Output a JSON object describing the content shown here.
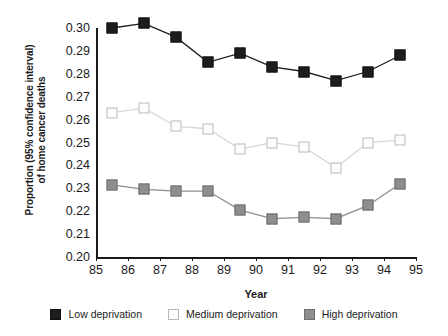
{
  "chart_data": {
    "type": "line",
    "title": "",
    "xlabel": "Year",
    "ylabel_line1": "Proportion (95% confidence interval)",
    "ylabel_line2": "of home cancer deaths",
    "x": [
      85.5,
      86.5,
      87.5,
      88.5,
      89.5,
      90.5,
      91.5,
      92.5,
      93.5,
      94.5
    ],
    "xlim": [
      85,
      95
    ],
    "ylim": [
      0.2,
      0.3
    ],
    "xticks": [
      "85",
      "86",
      "87",
      "88",
      "89",
      "90",
      "91",
      "92",
      "93",
      "94",
      "95"
    ],
    "xtick_values": [
      85,
      86,
      87,
      88,
      89,
      90,
      91,
      92,
      93,
      94,
      95
    ],
    "yticks": [
      "0.20",
      "0.21",
      "0.22",
      "0.23",
      "0.24",
      "0.25",
      "0.26",
      "0.27",
      "0.28",
      "0.29",
      "0.30"
    ],
    "ytick_values": [
      0.2,
      0.21,
      0.22,
      0.23,
      0.24,
      0.25,
      0.26,
      0.27,
      0.28,
      0.29,
      0.3
    ],
    "grid": false,
    "legend_position": "bottom",
    "series": [
      {
        "name": "Low deprivation",
        "color": "#1d1d1d",
        "marker": "filled-square",
        "values": [
          0.3,
          0.302,
          0.296,
          0.285,
          0.289,
          0.283,
          0.281,
          0.277,
          0.281,
          0.288
        ]
      },
      {
        "name": "Medium deprivation",
        "color": "#fdfdfd",
        "marker": "open-square",
        "values": [
          0.263,
          0.265,
          0.257,
          0.256,
          0.247,
          0.25,
          0.248,
          0.239,
          0.25,
          0.251
        ]
      },
      {
        "name": "High deprivation",
        "color": "#8e8e8e",
        "marker": "gray-square",
        "values": [
          0.2315,
          0.2295,
          0.2288,
          0.2288,
          0.2205,
          0.2168,
          0.2173,
          0.2168,
          0.2225,
          0.232
        ]
      }
    ]
  },
  "legend": {
    "items": [
      {
        "label": "Low deprivation"
      },
      {
        "label": "Medium deprivation"
      },
      {
        "label": "High deprivation"
      }
    ]
  }
}
